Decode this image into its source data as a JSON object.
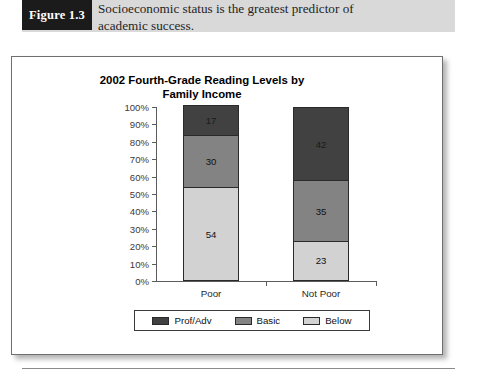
{
  "figure": {
    "label": "Figure 1.3",
    "caption_lines": [
      "Socioeconomic status is the greatest predictor of",
      "academic success."
    ]
  },
  "chart_data": {
    "type": "bar",
    "subtype": "stacked-column-100",
    "title": "2002 Fourth-Grade Reading Levels by Family Income",
    "title_lines": [
      "2002 Fourth-Grade Reading Levels by",
      "Family Income"
    ],
    "xlabel": "",
    "ylabel": "",
    "categories": [
      "Poor",
      "Not Poor"
    ],
    "ylim": [
      0,
      100
    ],
    "ytick_labels": [
      "0%",
      "10%",
      "20%",
      "30%",
      "40%",
      "50%",
      "60%",
      "70%",
      "80%",
      "90%",
      "100%"
    ],
    "ytick_values": [
      0,
      10,
      20,
      30,
      40,
      50,
      60,
      70,
      80,
      90,
      100
    ],
    "grid": false,
    "legend_position": "bottom",
    "stack_order_bottom_to_top": [
      "Below",
      "Basic",
      "Prof/Adv"
    ],
    "series": [
      {
        "name": "Prof/Adv",
        "color": "#414141",
        "values": [
          17,
          42
        ]
      },
      {
        "name": "Basic",
        "color": "#838383",
        "values": [
          30,
          35
        ]
      },
      {
        "name": "Below",
        "color": "#d2d2d2",
        "values": [
          54,
          23
        ]
      }
    ],
    "bars": [
      {
        "category": "Poor",
        "segments": [
          {
            "name": "Prof/Adv",
            "value": 17,
            "label": "17",
            "color": "#414141"
          },
          {
            "name": "Basic",
            "value": 30,
            "label": "30",
            "color": "#838383"
          },
          {
            "name": "Below",
            "value": 54,
            "label": "54",
            "color": "#d2d2d2"
          }
        ]
      },
      {
        "category": "Not Poor",
        "segments": [
          {
            "name": "Prof/Adv",
            "value": 42,
            "label": "42",
            "color": "#414141"
          },
          {
            "name": "Basic",
            "value": 35,
            "label": "35",
            "color": "#838383"
          },
          {
            "name": "Below",
            "value": 23,
            "label": "23",
            "color": "#d2d2d2"
          }
        ]
      }
    ],
    "legend": [
      {
        "label": "Prof/Adv",
        "color": "#414141"
      },
      {
        "label": "Basic",
        "color": "#838383"
      },
      {
        "label": "Below",
        "color": "#d2d2d2"
      }
    ]
  }
}
